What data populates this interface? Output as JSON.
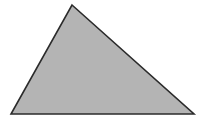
{
  "canvas": {
    "width": 198,
    "height": 121,
    "background_color": "#ffffff"
  },
  "figure": {
    "name": "triangle",
    "shape_type": "triangle",
    "label": "",
    "fill_color": "#b4b4b4",
    "stroke_color": "#2b2b2b",
    "stroke_width": 1.6,
    "fill_texture": "horizontal-scanlines",
    "points": "72,5 194,114 11,114",
    "vertices": [
      {
        "name": "apex",
        "x": 72,
        "y": 5
      },
      {
        "name": "bottom-right",
        "x": 194,
        "y": 114
      },
      {
        "name": "bottom-left",
        "x": 11,
        "y": 114
      }
    ]
  }
}
